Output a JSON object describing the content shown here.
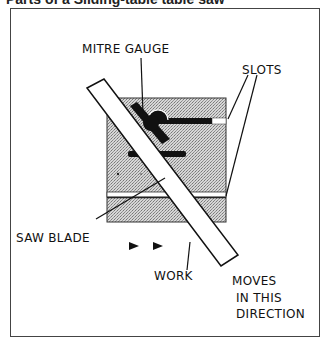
{
  "title": "Parts of a Sliding-table table saw",
  "diagram": {
    "labels": {
      "mitre_gauge": "MITRE GAUGE",
      "slots": "SLOTS",
      "saw_blade": "SAW BLADE",
      "work": "WORK",
      "moves_line1": "MOVES",
      "moves_line2": "IN THIS",
      "moves_line3": "DIRECTION"
    },
    "colors": {
      "table": "#c8c8c8",
      "ink": "#111111",
      "work": "#ffffff",
      "frame": "#444444"
    },
    "icons": [
      "arrow-right-icon",
      "arrow-right-icon"
    ]
  }
}
